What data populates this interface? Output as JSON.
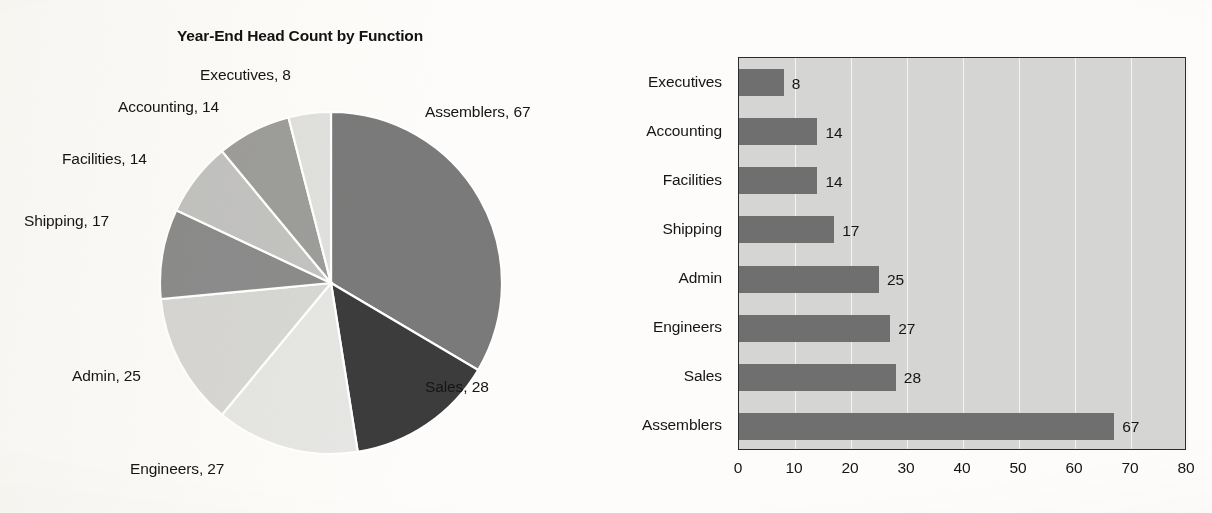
{
  "figure": {
    "background_color": "#fdfcfa",
    "pie_title": "Year-End Head Count by Function",
    "bar_title": "Year-End Head Count by Function"
  },
  "chart_data": [
    {
      "type": "pie",
      "title": "Year-End Head Count by Function",
      "categories": [
        "Assemblers",
        "Sales",
        "Engineers",
        "Admin",
        "Shipping",
        "Facilities",
        "Accounting",
        "Executives"
      ],
      "values": [
        67,
        28,
        27,
        25,
        17,
        14,
        14,
        8
      ],
      "total": 200,
      "start_angle_deg": 0,
      "direction": "clockwise",
      "slice_colors": [
        "#7a7a7a",
        "#3c3c3c",
        "#e6e6e4",
        "#d7d7d5",
        "#8c8c8c",
        "#c3c3c1",
        "#9d9d9b",
        "#e0e0de"
      ],
      "separator_color": "#ffffff",
      "labels": [
        {
          "text": "Assemblers, 67",
          "name": "Assemblers",
          "value": 67
        },
        {
          "text": "Sales, 28",
          "name": "Sales",
          "value": 28
        },
        {
          "text": "Engineers, 27",
          "name": "Engineers",
          "value": 27
        },
        {
          "text": "Admin, 25",
          "name": "Admin",
          "value": 25
        },
        {
          "text": "Shipping, 17",
          "name": "Shipping",
          "value": 17
        },
        {
          "text": "Facilities, 14",
          "name": "Facilities",
          "value": 14
        },
        {
          "text": "Accounting, 14",
          "name": "Accounting",
          "value": 14
        },
        {
          "text": "Executives, 8",
          "name": "Executives",
          "value": 8
        }
      ],
      "legend": "none",
      "grid": false
    },
    {
      "type": "bar",
      "orientation": "horizontal",
      "title": "Year-End Head Count by Function",
      "categories": [
        "Executives",
        "Accounting",
        "Facilities",
        "Shipping",
        "Admin",
        "Engineers",
        "Sales",
        "Assemblers"
      ],
      "values": [
        8,
        14,
        14,
        17,
        25,
        27,
        28,
        67
      ],
      "data_labels": [
        "8",
        "14",
        "14",
        "17",
        "25",
        "27",
        "28",
        "67"
      ],
      "xlabel": "",
      "ylabel": "",
      "xlim": [
        0,
        80
      ],
      "xticks": [
        0,
        10,
        20,
        30,
        40,
        50,
        60,
        70,
        80
      ],
      "xtick_labels": [
        "0",
        "10",
        "20",
        "30",
        "40",
        "50",
        "60",
        "70",
        "80"
      ],
      "bar_color": "#6f6f6f",
      "plot_background": "#d5d5d3",
      "gridline_color": "#f4f4f2",
      "axis_border_color": "#2b2b2b",
      "grid": true,
      "legend": "none"
    }
  ]
}
